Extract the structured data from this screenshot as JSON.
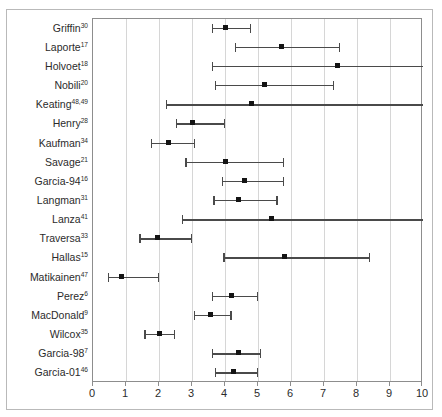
{
  "chart_data": {
    "type": "scatter",
    "title": "",
    "xlabel": "",
    "ylabel": "",
    "xlim": [
      0,
      10
    ],
    "ylim": [
      0,
      19
    ],
    "grid": true,
    "legend": null,
    "orientation": "horizontal",
    "xticks": [
      0,
      1,
      2,
      3,
      4,
      5,
      6,
      7,
      8,
      9,
      10
    ],
    "xtick_labels": [
      "0",
      "1",
      "2",
      "3",
      "4",
      "5",
      "6",
      "7",
      "8",
      "9",
      "10"
    ],
    "categories": [
      "Griffin",
      "Laporte",
      "Holvoet",
      "Nobili",
      "Keating",
      "Henry",
      "Kaufman",
      "Savage",
      "Garcia-94",
      "Langman",
      "Lanza",
      "Traversa",
      "Hallas",
      "Matikainen",
      "Perez",
      "MacDonald",
      "Wilcox",
      "Garcia-98",
      "Garcia-01"
    ],
    "rows": [
      {
        "label": "Griffin",
        "superscript": "30",
        "estimate": 4.0,
        "ci_low": 3.6,
        "ci_high": 4.8,
        "truncated_right": false
      },
      {
        "label": "Laporte",
        "superscript": "17",
        "estimate": 5.7,
        "ci_low": 4.3,
        "ci_high": 7.5,
        "truncated_right": false
      },
      {
        "label": "Holvoet",
        "superscript": "18",
        "estimate": 7.4,
        "ci_low": 3.6,
        "ci_high": 10.0,
        "truncated_right": true
      },
      {
        "label": "Nobili",
        "superscript": "20",
        "estimate": 5.2,
        "ci_low": 3.7,
        "ci_high": 7.3,
        "truncated_right": false
      },
      {
        "label": "Keating",
        "superscript": "48,49",
        "estimate": 4.8,
        "ci_low": 2.2,
        "ci_high": 10.0,
        "truncated_right": true
      },
      {
        "label": "Henry",
        "superscript": "28",
        "estimate": 3.0,
        "ci_low": 2.5,
        "ci_high": 4.0,
        "truncated_right": false
      },
      {
        "label": "Kaufman",
        "superscript": "34",
        "estimate": 2.3,
        "ci_low": 1.75,
        "ci_high": 3.1,
        "truncated_right": false
      },
      {
        "label": "Savage",
        "superscript": "21",
        "estimate": 4.0,
        "ci_low": 2.8,
        "ci_high": 5.8,
        "truncated_right": false
      },
      {
        "label": "Garcia-94",
        "superscript": "16",
        "estimate": 4.6,
        "ci_low": 3.9,
        "ci_high": 5.8,
        "truncated_right": false
      },
      {
        "label": "Langman",
        "superscript": "31",
        "estimate": 4.4,
        "ci_low": 3.65,
        "ci_high": 5.6,
        "truncated_right": false
      },
      {
        "label": "Lanza",
        "superscript": "41",
        "estimate": 5.4,
        "ci_low": 2.7,
        "ci_high": 10.0,
        "truncated_right": true
      },
      {
        "label": "Traversa",
        "superscript": "33",
        "estimate": 1.95,
        "ci_low": 1.4,
        "ci_high": 3.0,
        "truncated_right": false
      },
      {
        "label": "Hallas",
        "superscript": "15",
        "estimate": 5.8,
        "ci_low": 3.95,
        "ci_high": 8.4,
        "truncated_right": false
      },
      {
        "label": "Matikainen",
        "superscript": "47",
        "estimate": 0.85,
        "ci_low": 0.45,
        "ci_high": 2.0,
        "truncated_right": false
      },
      {
        "label": "Perez",
        "superscript": "6",
        "estimate": 4.2,
        "ci_low": 3.6,
        "ci_high": 5.0,
        "truncated_right": false
      },
      {
        "label": "MacDonald",
        "superscript": "9",
        "estimate": 3.55,
        "ci_low": 3.05,
        "ci_high": 4.2,
        "truncated_right": false
      },
      {
        "label": "Wilcox",
        "superscript": "35",
        "estimate": 2.0,
        "ci_low": 1.55,
        "ci_high": 2.5,
        "truncated_right": false
      },
      {
        "label": "Garcia-98",
        "superscript": "7",
        "estimate": 4.4,
        "ci_low": 3.6,
        "ci_high": 5.1,
        "truncated_right": false
      },
      {
        "label": "Garcia-01",
        "superscript": "46",
        "estimate": 4.25,
        "ci_low": 3.7,
        "ci_high": 5.0,
        "truncated_right": false
      }
    ],
    "values": [
      4.0,
      5.7,
      7.4,
      5.2,
      4.8,
      3.0,
      2.3,
      4.0,
      4.6,
      4.4,
      5.4,
      1.95,
      5.8,
      0.85,
      4.2,
      3.55,
      2.0,
      4.4,
      4.25
    ]
  },
  "colors": {
    "marker": "#141414",
    "whisker": "#4a4a4a",
    "gridline": "#d6d6d6",
    "axis": "#8d8d8d",
    "frame": "#b9b9b9",
    "background": "#ffffff",
    "text": "#2b2b2b"
  }
}
